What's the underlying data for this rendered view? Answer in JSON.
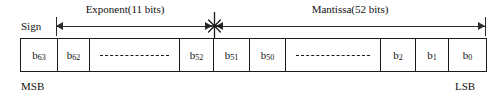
{
  "diagram": {
    "width": 504,
    "height": 99,
    "line_color": "#2b2b2b",
    "box_border_color": "#1a1a1a",
    "background": "#ffffff"
  },
  "labels": {
    "sign": "Sign",
    "exponent": "Exponent(11 bits)",
    "mantissa": "Mantissa(52 bits)",
    "msb": "MSB",
    "lsb": "LSB"
  },
  "spans": [
    {
      "name": "exponent",
      "label": "Exponent(11 bits)",
      "bits": 11,
      "from_bit": 62,
      "to_bit": 52
    },
    {
      "name": "mantissa",
      "label": "Mantissa(52 bits)",
      "bits": 52,
      "from_bit": 51,
      "to_bit": 0
    }
  ],
  "markers": {
    "junction": "asterisk-marker"
  },
  "bit_cells": [
    {
      "kind": "bit",
      "base": "b",
      "index": "63",
      "width": 37
    },
    {
      "kind": "bit",
      "base": "b",
      "index": "62",
      "width": 32
    },
    {
      "kind": "ellipsis",
      "base": "",
      "index": "",
      "width": 90
    },
    {
      "kind": "bit",
      "base": "b",
      "index": "52",
      "width": 34
    },
    {
      "kind": "bit",
      "base": "b",
      "index": "51",
      "width": 36
    },
    {
      "kind": "bit",
      "base": "b",
      "index": "50",
      "width": 36
    },
    {
      "kind": "ellipsis",
      "base": "",
      "index": "",
      "width": 95
    },
    {
      "kind": "bit",
      "base": "b",
      "index": "2",
      "width": 35
    },
    {
      "kind": "bit",
      "base": "b",
      "index": "1",
      "width": 33
    },
    {
      "kind": "bit",
      "base": "b",
      "index": "0",
      "width": 37
    }
  ]
}
